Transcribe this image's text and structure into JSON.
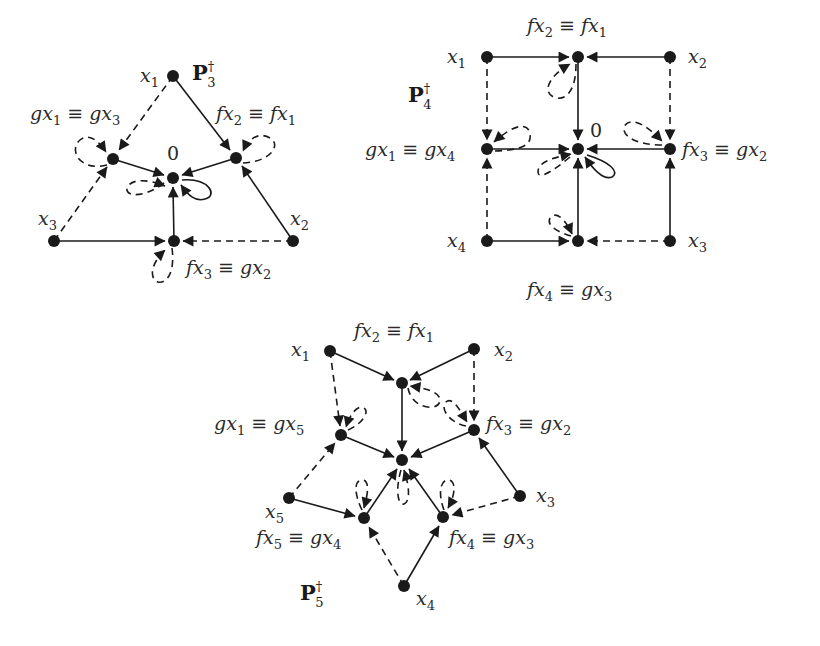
{
  "figure": {
    "graphs": [
      {
        "id": "P3",
        "title": {
          "base": "P",
          "sup": "†",
          "sub": "3"
        },
        "nodes": [
          {
            "id": "x1",
            "x": 173,
            "y": 76,
            "label": "x",
            "sub": "1",
            "lx": 140,
            "ly": 80
          },
          {
            "id": "gx1",
            "x": 113,
            "y": 159,
            "label": "gx₁ ≡ gx₃",
            "lx": 28,
            "ly": 113
          },
          {
            "id": "fx2",
            "x": 236,
            "y": 158,
            "label": "fx₂ ≡ fx₁",
            "lx": 215,
            "ly": 113
          },
          {
            "id": "zero",
            "x": 173,
            "y": 178,
            "label": "0",
            "lx": 167,
            "ly": 158
          },
          {
            "id": "x3",
            "x": 54,
            "y": 241,
            "label": "x",
            "sub": "3",
            "lx": 38,
            "ly": 222
          },
          {
            "id": "fx3",
            "x": 174,
            "y": 241,
            "label": "fx₃ ≡ gx₂",
            "lx": 185,
            "ly": 275
          },
          {
            "id": "x2",
            "x": 293,
            "y": 241,
            "label": "x",
            "sub": "2",
            "lx": 289,
            "ly": 222
          }
        ],
        "p_label_pos": {
          "x": 194,
          "y": 77
        }
      },
      {
        "id": "P4",
        "title": {
          "base": "P",
          "sup": "†",
          "sub": "4"
        },
        "nodes": [
          {
            "id": "x1",
            "label": "x₁"
          },
          {
            "id": "fx2",
            "label": "fx₂ ≡ fx₁"
          },
          {
            "id": "x2",
            "label": "x₂"
          },
          {
            "id": "gx1",
            "label": "gx₁ ≡ gx₄"
          },
          {
            "id": "zero",
            "label": "0"
          },
          {
            "id": "fx3",
            "label": "fx₃ ≡ gx₂"
          },
          {
            "id": "x4",
            "label": "x₄"
          },
          {
            "id": "fx4",
            "label": "fx₄ ≡ gx₃"
          },
          {
            "id": "x3",
            "label": "x₃"
          }
        ]
      },
      {
        "id": "P5",
        "title": {
          "base": "P",
          "sup": "†",
          "sub": "5"
        },
        "nodes": [
          {
            "id": "x1",
            "label": "x₁"
          },
          {
            "id": "fx2",
            "label": "fx₂ ≡ fx₁"
          },
          {
            "id": "x2",
            "label": "x₂"
          },
          {
            "id": "gx1",
            "label": "gx₁ ≡ gx₅"
          },
          {
            "id": "fx3",
            "label": "fx₃ ≡ gx₂"
          },
          {
            "id": "zero",
            "label": "0"
          },
          {
            "id": "x5",
            "label": "x₅"
          },
          {
            "id": "fx5",
            "label": "fx₅ ≡ gx₄"
          },
          {
            "id": "fx4",
            "label": "fx₄ ≡ gx₃"
          },
          {
            "id": "x3",
            "label": "x₃"
          },
          {
            "id": "x4",
            "label": "x₄"
          }
        ]
      }
    ],
    "labels": {
      "p3": {
        "base": "P",
        "sup": "†",
        "sub": "3"
      },
      "p4": {
        "base": "P",
        "sup": "†",
        "sub": "4"
      },
      "p5": {
        "base": "P",
        "sup": "†",
        "sub": "5"
      },
      "p3_x1": "x",
      "p3_x1_sub": "1",
      "p3_x2": "x",
      "p3_x2_sub": "2",
      "p3_x3": "x",
      "p3_x3_sub": "3",
      "p3_gx": {
        "a": "gx",
        "a_sub": "1",
        "eq": " ≡ ",
        "b": "gx",
        "b_sub": "3"
      },
      "p3_fx2": {
        "a": "fx",
        "a_sub": "2",
        "eq": " ≡ ",
        "b": "fx",
        "b_sub": "1"
      },
      "p3_fx3": {
        "a": "fx",
        "a_sub": "3",
        "eq": " ≡ ",
        "b": "gx",
        "b_sub": "2"
      },
      "p3_zero": "0",
      "p4_x1": "x",
      "p4_x1_sub": "1",
      "p4_x2": "x",
      "p4_x2_sub": "2",
      "p4_x3": "x",
      "p4_x3_sub": "3",
      "p4_x4": "x",
      "p4_x4_sub": "4",
      "p4_fx2": {
        "a": "fx",
        "a_sub": "2",
        "eq": " ≡ ",
        "b": "fx",
        "b_sub": "1"
      },
      "p4_gx1": {
        "a": "gx",
        "a_sub": "1",
        "eq": " ≡ ",
        "b": "gx",
        "b_sub": "4"
      },
      "p4_fx3": {
        "a": "fx",
        "a_sub": "3",
        "eq": " ≡ ",
        "b": "gx",
        "b_sub": "2"
      },
      "p4_fx4": {
        "a": "fx",
        "a_sub": "4",
        "eq": " ≡ ",
        "b": "gx",
        "b_sub": "3"
      },
      "p4_zero": "0",
      "p5_x1": "x",
      "p5_x1_sub": "1",
      "p5_x2": "x",
      "p5_x2_sub": "2",
      "p5_x3": "x",
      "p5_x3_sub": "3",
      "p5_x4": "x",
      "p5_x4_sub": "4",
      "p5_x5": "x",
      "p5_x5_sub": "5",
      "p5_fx2": {
        "a": "fx",
        "a_sub": "2",
        "eq": " ≡ ",
        "b": "fx",
        "b_sub": "1"
      },
      "p5_gx1": {
        "a": "gx",
        "a_sub": "1",
        "eq": " ≡ ",
        "b": "gx",
        "b_sub": "5"
      },
      "p5_fx3": {
        "a": "fx",
        "a_sub": "3",
        "eq": " ≡ ",
        "b": "gx",
        "b_sub": "2"
      },
      "p5_fx5": {
        "a": "fx",
        "a_sub": "5",
        "eq": " ≡ ",
        "b": "gx",
        "b_sub": "4"
      },
      "p5_fx4": {
        "a": "fx",
        "a_sub": "4",
        "eq": " ≡ ",
        "b": "gx",
        "b_sub": "3"
      }
    },
    "colors": {
      "ink": "#1a1a1a",
      "background": "#ffffff"
    }
  }
}
